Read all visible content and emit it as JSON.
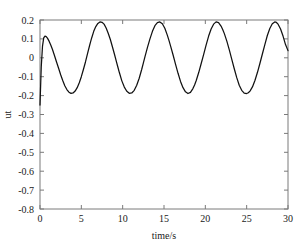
{
  "chart_data": {
    "type": "line",
    "title": "",
    "xlabel": "time/s",
    "ylabel": "ut",
    "xlim": [
      0,
      30
    ],
    "ylim": [
      -0.8,
      0.2
    ],
    "xticks": [
      0,
      5,
      10,
      15,
      20,
      25,
      30
    ],
    "xticklabels": [
      "0",
      "5",
      "10",
      "15",
      "20",
      "25",
      "30"
    ],
    "yticks": [
      -0.8,
      -0.7,
      -0.6,
      -0.5,
      -0.4,
      -0.3,
      -0.2,
      -0.1,
      0,
      0.1,
      0.2
    ],
    "yticklabels": [
      "-0.8",
      "-0.7",
      "-0.6",
      "-0.5",
      "-0.4",
      "-0.3",
      "-0.2",
      "-0.1",
      "0",
      "0.1",
      "0.2"
    ],
    "grid": false,
    "legend": null,
    "line_color": "#111111",
    "series": [
      {
        "name": "ut",
        "x": [
          0.0,
          0.15,
          0.3,
          0.45,
          0.6,
          0.75,
          0.9,
          1.1,
          1.3,
          1.5,
          1.75,
          2.0,
          2.25,
          2.5,
          2.75,
          3.0,
          3.25,
          3.5,
          3.75,
          4.0,
          4.25,
          4.5,
          4.75,
          5.0,
          5.25,
          5.5,
          5.75,
          6.0,
          6.1,
          6.25,
          6.5,
          6.75,
          7.0,
          7.25,
          7.5,
          7.75,
          8.0,
          8.25,
          8.5,
          8.75,
          9.0,
          9.25,
          9.4,
          9.6,
          9.9,
          10.2,
          10.5,
          10.8,
          11.1,
          11.4,
          11.7,
          12.0,
          12.3,
          12.5,
          12.7,
          13.0,
          13.3,
          13.6,
          13.9,
          14.2,
          14.5,
          14.8,
          15.1,
          15.4,
          15.6,
          15.8,
          16.1,
          16.4,
          16.7,
          17.0,
          17.3,
          17.6,
          17.9,
          18.2,
          18.5,
          18.7,
          18.9,
          19.2,
          19.5,
          19.8,
          20.1,
          20.4,
          20.7,
          21.0,
          21.3,
          21.6,
          21.9,
          22.1,
          22.3,
          22.6,
          22.9,
          23.2,
          23.5,
          23.8,
          24.1,
          24.4,
          24.7,
          25.0,
          25.2,
          25.4,
          25.7,
          26.0,
          26.3,
          26.6,
          26.9,
          27.2,
          27.5,
          27.8,
          28.1,
          28.4,
          28.6,
          28.8,
          29.1,
          29.4,
          29.7,
          30.0
        ],
        "y": [
          -0.25,
          -0.05,
          0.06,
          0.105,
          0.115,
          0.112,
          0.104,
          0.088,
          0.068,
          0.045,
          0.012,
          -0.022,
          -0.055,
          -0.09,
          -0.12,
          -0.148,
          -0.168,
          -0.182,
          -0.188,
          -0.186,
          -0.176,
          -0.158,
          -0.132,
          -0.1,
          -0.062,
          -0.022,
          0.022,
          0.065,
          0.082,
          0.105,
          0.14,
          0.165,
          0.182,
          0.19,
          0.188,
          0.178,
          0.158,
          0.13,
          0.098,
          0.06,
          0.02,
          -0.022,
          -0.046,
          -0.078,
          -0.122,
          -0.155,
          -0.177,
          -0.188,
          -0.186,
          -0.172,
          -0.145,
          -0.108,
          -0.062,
          -0.028,
          0.006,
          0.055,
          0.1,
          0.14,
          0.17,
          0.186,
          0.19,
          0.18,
          0.156,
          0.12,
          0.092,
          0.062,
          0.015,
          -0.035,
          -0.082,
          -0.125,
          -0.158,
          -0.18,
          -0.189,
          -0.183,
          -0.163,
          -0.144,
          -0.12,
          -0.078,
          -0.03,
          0.018,
          0.068,
          0.115,
          0.152,
          0.178,
          0.19,
          0.186,
          0.168,
          0.15,
          0.128,
          0.088,
          0.042,
          -0.008,
          -0.058,
          -0.105,
          -0.145,
          -0.172,
          -0.187,
          -0.189,
          -0.185,
          -0.176,
          -0.154,
          -0.12,
          -0.078,
          -0.03,
          0.02,
          0.07,
          0.118,
          0.155,
          0.18,
          0.19,
          0.187,
          0.178,
          0.152,
          0.115,
          0.07,
          0.038
        ]
      }
    ]
  },
  "axes": {
    "xlabel_text": "time/s",
    "ylabel_text": "ut"
  }
}
